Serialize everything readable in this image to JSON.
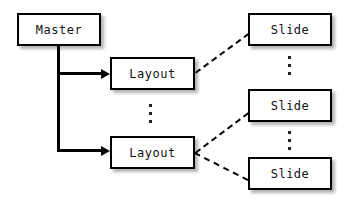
{
  "diagram": {
    "background_color": "#ffffff",
    "line_color": "#000000",
    "box_fill": "#ffffff",
    "nodes": [
      {
        "id": "master",
        "label": "Master",
        "x": 17,
        "y": 13,
        "w": 84,
        "h": 33
      },
      {
        "id": "layout1",
        "label": "Layout",
        "x": 110,
        "y": 57,
        "w": 85,
        "h": 33
      },
      {
        "id": "layout2",
        "label": "Layout",
        "x": 110,
        "y": 136,
        "w": 85,
        "h": 33
      },
      {
        "id": "slide1",
        "label": "Slide",
        "x": 248,
        "y": 13,
        "w": 84,
        "h": 33
      },
      {
        "id": "slide2",
        "label": "Slide",
        "x": 248,
        "y": 89,
        "w": 84,
        "h": 33
      },
      {
        "id": "slide3",
        "label": "Slide",
        "x": 248,
        "y": 157,
        "w": 84,
        "h": 33
      }
    ],
    "ellipses": [
      {
        "id": "layout-ellipsis",
        "x": 148,
        "y": 104,
        "h": 19
      },
      {
        "id": "slide-ellipsis-1",
        "x": 287,
        "y": 56,
        "h": 19
      },
      {
        "id": "slide-ellipsis-2",
        "x": 287,
        "y": 131,
        "h": 19
      }
    ],
    "solid_edges": [
      {
        "id": "master-to-layout1",
        "from": "master",
        "to": "layout1",
        "style": "solid",
        "arrow": true
      },
      {
        "id": "master-to-layout2",
        "from": "master",
        "to": "layout2",
        "style": "solid",
        "arrow": true
      }
    ],
    "dashed_edges": [
      {
        "id": "layout1-to-slide1",
        "from": "layout1",
        "to": "slide1",
        "style": "dashed",
        "arrow": false
      },
      {
        "id": "layout2-to-slide2",
        "from": "layout2",
        "to": "slide2",
        "style": "dashed",
        "arrow": false
      },
      {
        "id": "layout2-to-slide3",
        "from": "layout2",
        "to": "slide3",
        "style": "dashed",
        "arrow": false
      }
    ]
  }
}
